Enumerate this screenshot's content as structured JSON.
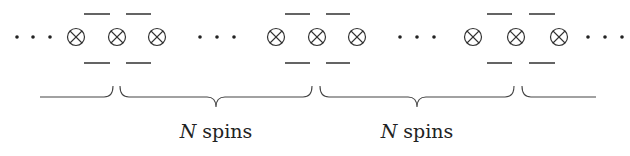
{
  "diagram": {
    "spin_symbol": "⊗",
    "ellipsis": "···",
    "row_y": 37,
    "dash_top_y": 14,
    "dash_bottom_y": 63,
    "ellipses": [
      {
        "id": "left",
        "x": [
          17,
          33,
          50
        ]
      },
      {
        "id": "gap-1",
        "x": [
          200,
          217,
          234
        ]
      },
      {
        "id": "gap-2",
        "x": [
          400,
          417,
          434
        ]
      },
      {
        "id": "right",
        "x": [
          588,
          605,
          622
        ]
      }
    ],
    "spin_groups": [
      {
        "spins_x": [
          76,
          117,
          157
        ],
        "dashes": [
          [
            84,
            110
          ],
          [
            126,
            151
          ]
        ]
      },
      {
        "spins_x": [
          276,
          317,
          357
        ],
        "dashes": [
          [
            285,
            310
          ],
          [
            326,
            350
          ]
        ]
      },
      {
        "spins_x": [
          473,
          516,
          559
        ],
        "dashes": [
          [
            487,
            512
          ],
          [
            529,
            555
          ]
        ]
      }
    ],
    "braces": [
      {
        "id": "partial-left",
        "x_start": 40,
        "x_end": 113,
        "type": "right-end"
      },
      {
        "id": "block-1",
        "x_start": 120,
        "x_end": 312,
        "tip_x": 216
      },
      {
        "id": "block-2",
        "x_start": 320,
        "x_end": 514,
        "tip_x": 417
      },
      {
        "id": "partial-right",
        "x_start": 522,
        "x_end": 596,
        "type": "left-end"
      }
    ],
    "labels": [
      {
        "var": "N",
        "text": " spins",
        "x": 216,
        "y": 120
      },
      {
        "var": "N",
        "text": " spins",
        "x": 417,
        "y": 120
      }
    ]
  }
}
